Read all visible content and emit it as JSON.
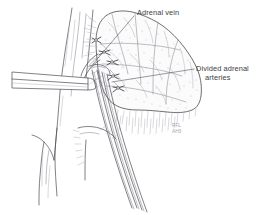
{
  "figure": {
    "domain": "medical-illustration",
    "background_color": "#ffffff",
    "ink_color": "#4a4a52",
    "soft_ink_color": "#7e7e88",
    "faint_ink_color": "#a9a9b2",
    "text_color": "#3c3c44",
    "width": 264,
    "height": 215
  },
  "labels": [
    {
      "id": "adrenal-vein",
      "text": "Adrenal vein",
      "x": 137,
      "y": 8,
      "leader_from": [
        134,
        16
      ],
      "leader_to": [
        93,
        64
      ]
    },
    {
      "id": "divided-adrenal-arteries",
      "line1": "Divided adrenal",
      "line2": "arteries",
      "x": 196,
      "y": 64,
      "leader_from": [
        194,
        69
      ],
      "leader_to": [
        112,
        82
      ]
    }
  ],
  "signature": {
    "line1": "RFL",
    "line2": "AH3"
  },
  "anatomy": [
    {
      "name": "adrenal-gland",
      "description": "Stippled lobulated gland, right of midline"
    },
    {
      "name": "vena-cava",
      "description": "Vertical great vessel on the left"
    },
    {
      "name": "adrenal-vein",
      "description": "Vein running from gland hilum to cava"
    },
    {
      "name": "divided-adrenal-arteries",
      "description": "Clipped small arteries at gland hilum"
    },
    {
      "name": "retractor",
      "description": "Flat blade instrument entering from left"
    },
    {
      "name": "clamp-instrument",
      "description": "Long clamp shafts descending to lower right"
    },
    {
      "name": "ligature-clips",
      "description": "Small tie knots on divided vessels"
    }
  ]
}
